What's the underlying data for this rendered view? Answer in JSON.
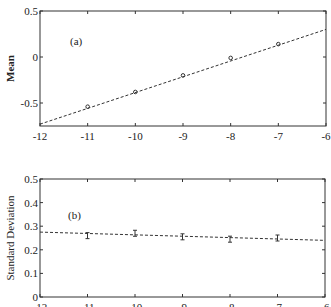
{
  "chart_data": [
    {
      "type": "scatter",
      "panel_label": "(a)",
      "title": "",
      "xlabel": "",
      "ylabel": "Mean",
      "xlim": [
        -12,
        -6
      ],
      "ylim": [
        -0.75,
        0.5
      ],
      "xticks": [
        "-12",
        "-11",
        "-10",
        "-9",
        "-8",
        "-7",
        "-6"
      ],
      "yticks": [
        "0.5",
        "0",
        "-0.5"
      ],
      "grid": false,
      "series": [
        {
          "name": "data",
          "x": [
            -11,
            -10,
            -9,
            -8,
            -7
          ],
          "y": [
            -0.54,
            -0.38,
            -0.2,
            -0.01,
            0.14
          ],
          "marker": "circle"
        },
        {
          "name": "linear fit",
          "x": [
            -12,
            -6
          ],
          "y": [
            -0.73,
            0.3
          ],
          "style": "dashed"
        }
      ]
    },
    {
      "type": "scatter",
      "panel_label": "(b)",
      "title": "",
      "xlabel": "",
      "ylabel": "Standard Deviation",
      "xlim": [
        -12,
        -6
      ],
      "ylim": [
        0,
        0.5
      ],
      "xticks": [
        "-12",
        "-11",
        "-10",
        "-9",
        "-8",
        "-7",
        "-6"
      ],
      "yticks": [
        "0.5",
        "0.4",
        "0.3",
        "0.2",
        "0.1",
        "0"
      ],
      "grid": false,
      "series": [
        {
          "name": "data",
          "x": [
            -11,
            -10,
            -9,
            -8,
            -7
          ],
          "y": [
            0.26,
            0.27,
            0.255,
            0.245,
            0.25
          ],
          "marker": "errorbar"
        },
        {
          "name": "linear fit",
          "x": [
            -12,
            -6
          ],
          "y": [
            0.275,
            0.24
          ],
          "style": "dashed"
        }
      ]
    }
  ]
}
